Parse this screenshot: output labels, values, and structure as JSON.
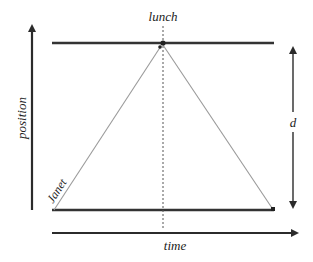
{
  "diagram": {
    "type": "position-time diagram",
    "labels": {
      "x_axis": "time",
      "y_axis": "position",
      "event": "lunch",
      "distance": "d",
      "walker": "Janet"
    },
    "colors": {
      "axis": "#2b2b2b",
      "track": "#333333",
      "worldline": "#9a9a9a",
      "dashed": "#555555"
    }
  }
}
